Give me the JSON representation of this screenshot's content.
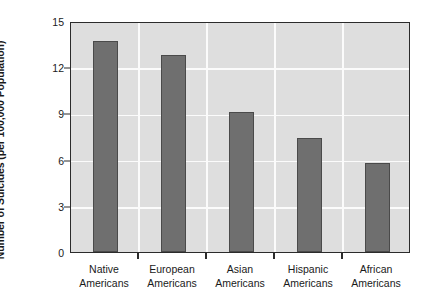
{
  "chart_data": {
    "type": "bar",
    "title": "",
    "xlabel": "",
    "ylabel": "Number of Suicides (per 100,000 Population)",
    "categories": [
      "Native Americans",
      "European Americans",
      "Asian Americans",
      "Hispanic Americans",
      "African Americans"
    ],
    "category_lines": [
      [
        "Native",
        "Americans"
      ],
      [
        "European",
        "Americans"
      ],
      [
        "Asian",
        "Americans"
      ],
      [
        "Hispanic",
        "Americans"
      ],
      [
        "African",
        "Americans"
      ]
    ],
    "values": [
      13.7,
      12.8,
      9.1,
      7.4,
      5.8
    ],
    "ylim": [
      0,
      15
    ],
    "yticks": [
      0,
      3,
      6,
      9,
      12,
      15
    ],
    "ytick_labels": [
      "0",
      "3",
      "6",
      "9",
      "12",
      "15"
    ],
    "grid": true,
    "grid_axis": "both",
    "legend": "none",
    "colors": {
      "bar_fill": "#6f6f6f",
      "bar_edge": "#4a4a4a",
      "plot_background": "#dedede",
      "gridline": "#fbfbfb",
      "axis": "#2b2b2b",
      "text": "#1a1a1a",
      "figure_background": "#ffffff"
    }
  }
}
